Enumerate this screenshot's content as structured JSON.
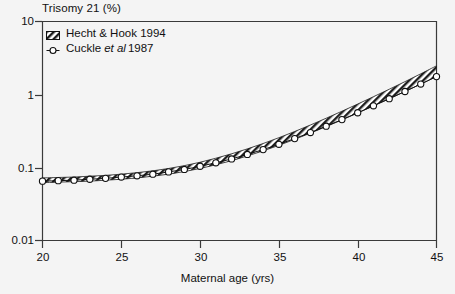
{
  "chart_data": {
    "type": "line",
    "title": "Trisomy 21 (%)",
    "xlabel": "Maternal age (yrs)",
    "ylabel": "Trisomy 21 (%)",
    "yscale": "log",
    "ylim": [
      0.01,
      10
    ],
    "xlim": [
      20,
      45
    ],
    "grid": false,
    "legend_position": "top-left",
    "xticks": [
      "20",
      "25",
      "30",
      "35",
      "40",
      "45"
    ],
    "xtick_values": [
      20,
      25,
      30,
      35,
      40,
      45
    ],
    "yticks": [
      "10",
      "1",
      "0.1",
      "0.01"
    ],
    "ytick_values": [
      10,
      1,
      0.1,
      0.01
    ],
    "x": [
      20,
      21,
      22,
      23,
      24,
      25,
      26,
      27,
      28,
      29,
      30,
      31,
      32,
      33,
      34,
      35,
      36,
      37,
      38,
      39,
      40,
      41,
      42,
      43,
      44,
      45
    ],
    "series": [
      {
        "name": "Hecht & Hook 1994",
        "style": "hatched-band",
        "band_lower": [
          0.062,
          0.063,
          0.064,
          0.065,
          0.067,
          0.069,
          0.072,
          0.076,
          0.081,
          0.088,
          0.097,
          0.109,
          0.124,
          0.144,
          0.169,
          0.201,
          0.243,
          0.296,
          0.363,
          0.449,
          0.558,
          0.697,
          0.874,
          1.1,
          1.39,
          1.76
        ],
        "band_upper": [
          0.072,
          0.073,
          0.074,
          0.076,
          0.078,
          0.081,
          0.085,
          0.09,
          0.097,
          0.106,
          0.118,
          0.134,
          0.154,
          0.18,
          0.213,
          0.256,
          0.311,
          0.382,
          0.473,
          0.59,
          0.74,
          0.933,
          1.18,
          1.5,
          1.92,
          2.47
        ],
        "values": [
          0.067,
          0.068,
          0.069,
          0.07,
          0.072,
          0.075,
          0.078,
          0.083,
          0.089,
          0.097,
          0.107,
          0.121,
          0.139,
          0.161,
          0.19,
          0.227,
          0.276,
          0.338,
          0.417,
          0.518,
          0.647,
          0.812,
          1.02,
          1.29,
          1.65,
          2.1
        ]
      },
      {
        "name": "Cuckle et al 1987",
        "style": "open-circle-markers",
        "values": [
          0.065,
          0.066,
          0.067,
          0.069,
          0.071,
          0.074,
          0.077,
          0.081,
          0.087,
          0.094,
          0.104,
          0.116,
          0.131,
          0.151,
          0.176,
          0.208,
          0.249,
          0.301,
          0.368,
          0.453,
          0.562,
          0.7,
          0.876,
          1.1,
          1.39,
          1.76
        ]
      }
    ],
    "annotations": []
  },
  "legend": {
    "entries": [
      {
        "label": "Hecht & Hook 1994",
        "marker": "hatched-swatch-icon"
      },
      {
        "label_pre": "Cuckle",
        "label_italic": "et al",
        "label_post": "1987",
        "marker": "open-circle-icon"
      }
    ]
  },
  "colors": {
    "background": "#f4f4f4",
    "axis": "#3a3a3a",
    "ink": "#111111",
    "band_fill": "#ffffff",
    "band_hatch": "#202020",
    "marker_fill": "#ffffff",
    "marker_edge": "#111111"
  }
}
